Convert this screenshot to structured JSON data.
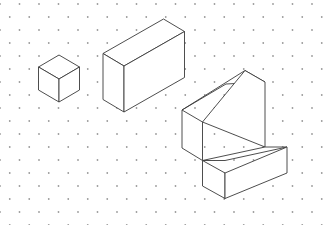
{
  "drawing": {
    "title": "Isometric Solids on Dot Grid",
    "description": "Three solid figures drawn in isometric projection on an isometric dot grid",
    "background_color": "#ffffff",
    "line_color": "#3a3a3a",
    "dot_color": "#9a9a9a",
    "canvas": {
      "width": 326,
      "height": 225
    }
  },
  "grid": {
    "type": "isometric-dot-grid",
    "dot_radius": 0.9,
    "column_spacing": 19.5,
    "row_spacing": 13.0,
    "row_stagger": 9.75,
    "origin_x": 0.0,
    "origin_y": 4.0,
    "columns": 18,
    "rows": 18
  },
  "shapes": [
    {
      "name": "small-cube",
      "label": "Cube",
      "units": {
        "width": 1,
        "depth": 1,
        "height": 1
      },
      "anchor": {
        "x": 38.5,
        "y": 67.0
      },
      "unit_px": 20.5,
      "faces": {
        "top": [
          [
            38.5,
            67.0
          ],
          [
            59.0,
            55.0
          ],
          [
            79.5,
            67.0
          ],
          [
            59.0,
            79.0
          ]
        ],
        "left": [
          [
            38.5,
            67.0
          ],
          [
            59.0,
            79.0
          ],
          [
            59.0,
            102.0
          ],
          [
            38.5,
            90.0
          ]
        ],
        "right": [
          [
            59.0,
            79.0
          ],
          [
            79.5,
            67.0
          ],
          [
            79.5,
            90.0
          ],
          [
            59.0,
            102.0
          ]
        ]
      }
    },
    {
      "name": "wide-box",
      "label": "Rectangular Prism",
      "units": {
        "width": 3,
        "depth": 1,
        "height": 2
      },
      "anchor": {
        "x": 103.0,
        "y": 65.0
      },
      "unit_px": 20.5,
      "faces": {
        "top": [
          [
            103.0,
            53.5
          ],
          [
            163.5,
            19.0
          ],
          [
            184.5,
            31.5
          ],
          [
            124.0,
            66.0
          ]
        ],
        "left": [
          [
            103.0,
            53.5
          ],
          [
            124.0,
            66.0
          ],
          [
            124.0,
            112.0
          ],
          [
            103.0,
            99.5
          ]
        ],
        "right": [
          [
            124.0,
            66.0
          ],
          [
            184.5,
            31.5
          ],
          [
            184.5,
            77.5
          ],
          [
            124.0,
            112.0
          ]
        ]
      }
    },
    {
      "name": "l-shaped-step-block",
      "label": "L-Shaped Step Block",
      "units": {
        "width": 2,
        "depth": 2,
        "back_height": 3,
        "step_height": 1
      },
      "anchor": {
        "x": 182.0,
        "y": 110.0
      },
      "unit_px": 20.5,
      "faces": {
        "back_top": [
          [
            182.0,
            110.0
          ],
          [
            226.0,
            84.0
          ],
          [
            265.0,
            82.0
          ],
          [
            245.0,
            70.5
          ]
        ],
        "back_left": [
          [
            182.0,
            110.0
          ],
          [
            202.5,
            122.0
          ],
          [
            202.5,
            160.5
          ],
          [
            182.0,
            148.0
          ]
        ],
        "back_front_upper": [
          [
            202.5,
            122.0
          ],
          [
            245.0,
            70.5
          ],
          [
            265.0,
            82.0
          ],
          [
            265.0,
            147.0
          ]
        ],
        "step_top": [
          [
            202.5,
            160.5
          ],
          [
            265.0,
            147.0
          ],
          [
            287.0,
            147.0
          ],
          [
            225.0,
            160.5
          ]
        ],
        "step_front": [
          [
            202.5,
            160.5
          ],
          [
            225.0,
            173.0
          ],
          [
            225.0,
            198.5
          ],
          [
            202.5,
            186.0
          ]
        ],
        "step_right": [
          [
            225.0,
            173.0
          ],
          [
            287.0,
            147.0
          ],
          [
            287.0,
            173.0
          ],
          [
            225.0,
            198.5
          ]
        ]
      }
    }
  ]
}
